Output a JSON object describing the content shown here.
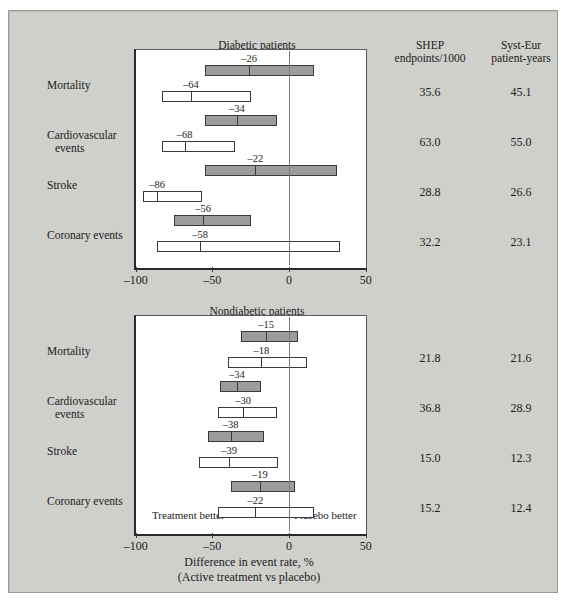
{
  "figure": {
    "columns": {
      "shep": {
        "line1": "SHEP",
        "line2": "endpoints/1000"
      },
      "systeur": {
        "line1": "Syst-Eur",
        "line2": "patient-years"
      }
    },
    "axis": {
      "ticks": [
        "–100",
        "–50",
        "0",
        "50"
      ],
      "tick_values": [
        -100,
        -50,
        0,
        50
      ],
      "caption_line1": "Difference in event rate, %",
      "caption_line2": "(Active treatment vs placebo)"
    },
    "notes": {
      "treatment_better": "Treatment better",
      "placebo_better": "Placebo better"
    },
    "colors": {
      "background": "#cfcfcb",
      "panel": "#ffffff",
      "shep_bar": "#9c9c9c",
      "systeur_bar": "#ffffff",
      "ink": "#1c1c1c"
    }
  },
  "chart_data": {
    "type": "bar",
    "title": "Difference in event rate, % (Active treatment vs placebo)",
    "xlabel": "Difference in event rate, %",
    "ylabel": "",
    "xlim": [
      -100,
      50
    ],
    "grid": false,
    "legend": [
      "SHEP",
      "Syst-Eur"
    ],
    "panels": [
      {
        "name": "diabetic",
        "title": "Diabetic patients",
        "rows": [
          {
            "label_line1": "Mortality",
            "label_line2": "",
            "shep": {
              "point": -26,
              "label": "–26",
              "ci_low": -55,
              "ci_high": 16,
              "endpoints": "35.6"
            },
            "systeur": {
              "point": -64,
              "label": "–64",
              "ci_low": -83,
              "ci_high": -25,
              "endpoints": "45.1"
            }
          },
          {
            "label_line1": "Cardiovascular",
            "label_line2": "events",
            "shep": {
              "point": -34,
              "label": "–34",
              "ci_low": -55,
              "ci_high": -8,
              "endpoints": "63.0"
            },
            "systeur": {
              "point": -68,
              "label": "–68",
              "ci_low": -83,
              "ci_high": -35,
              "endpoints": "55.0"
            }
          },
          {
            "label_line1": "Stroke",
            "label_line2": "",
            "shep": {
              "point": -22,
              "label": "–22",
              "ci_low": -55,
              "ci_high": 31,
              "endpoints": "28.8"
            },
            "systeur": {
              "point": -86,
              "label": "–86",
              "ci_low": -95,
              "ci_high": -57,
              "endpoints": "26.6"
            }
          },
          {
            "label_line1": "Coronary events",
            "label_line2": "",
            "shep": {
              "point": -56,
              "label": "–56",
              "ci_low": -75,
              "ci_high": -25,
              "endpoints": "32.2"
            },
            "systeur": {
              "point": -58,
              "label": "–58",
              "ci_low": -86,
              "ci_high": 33,
              "endpoints": "23.1"
            }
          }
        ]
      },
      {
        "name": "nondiabetic",
        "title": "Nondiabetic patients",
        "rows": [
          {
            "label_line1": "Mortality",
            "label_line2": "",
            "shep": {
              "point": -15,
              "label": "–15",
              "ci_low": -31,
              "ci_high": 6,
              "endpoints": "21.8"
            },
            "systeur": {
              "point": -18,
              "label": "–18",
              "ci_low": -40,
              "ci_high": 12,
              "endpoints": "21.6"
            }
          },
          {
            "label_line1": "Cardiovascular",
            "label_line2": "events",
            "shep": {
              "point": -34,
              "label": "–34",
              "ci_low": -45,
              "ci_high": -18,
              "endpoints": "36.8"
            },
            "systeur": {
              "point": -30,
              "label": "–30",
              "ci_low": -46,
              "ci_high": -8,
              "endpoints": "28.9"
            }
          },
          {
            "label_line1": "Stroke",
            "label_line2": "",
            "shep": {
              "point": -38,
              "label": "–38",
              "ci_low": -53,
              "ci_high": -16,
              "endpoints": "15.0"
            },
            "systeur": {
              "point": -39,
              "label": "–39",
              "ci_low": -59,
              "ci_high": -7,
              "endpoints": "12.3"
            }
          },
          {
            "label_line1": "Coronary events",
            "label_line2": "",
            "shep": {
              "point": -19,
              "label": "–19",
              "ci_low": -38,
              "ci_high": 4,
              "endpoints": "15.2"
            },
            "systeur": {
              "point": -22,
              "label": "–22",
              "ci_low": -46,
              "ci_high": 16,
              "endpoints": "12.4"
            }
          }
        ]
      }
    ]
  }
}
